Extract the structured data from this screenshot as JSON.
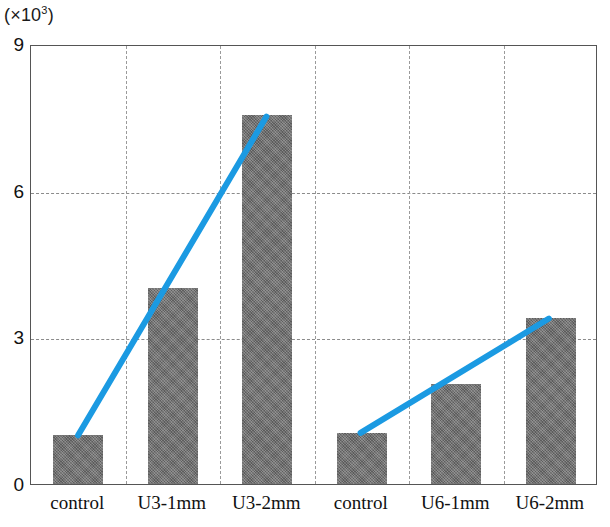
{
  "chart_data": {
    "type": "bar",
    "title": "",
    "subtitle": "",
    "xlabel": "",
    "ylabel": "(×10³)",
    "ylabel_base": "(×10",
    "ylabel_exp": "3",
    "ylabel_close": ")",
    "categories": [
      "control",
      "U3-1mm",
      "U3-2mm",
      "control",
      "U6-1mm",
      "U6-2mm"
    ],
    "values": [
      1.0,
      4.0,
      7.55,
      1.05,
      2.05,
      3.4
    ],
    "series": [
      {
        "name": "bars",
        "type": "bar",
        "values": [
          1.0,
          4.0,
          7.55,
          1.05,
          2.05,
          3.4
        ]
      },
      {
        "name": "U3 trend",
        "type": "line",
        "color": "#1b9ae2",
        "x": [
          "control",
          "U3-2mm"
        ],
        "x_index": [
          0,
          2
        ],
        "values": [
          1.0,
          7.55
        ]
      },
      {
        "name": "U6 trend",
        "type": "line",
        "color": "#1b9ae2",
        "x": [
          "control",
          "U6-2mm"
        ],
        "x_index": [
          3,
          5
        ],
        "values": [
          1.05,
          3.4
        ]
      }
    ],
    "ylim": [
      0,
      9
    ],
    "yticks": [
      0,
      3,
      6,
      9
    ],
    "ytick_labels": [
      "0",
      "3",
      "6",
      "9"
    ],
    "grid": {
      "horizontal": true,
      "vertical": true,
      "horizontal_at": [
        3,
        6
      ],
      "vertical_between_categories": true,
      "style": "dashed",
      "color": "#8f8f8f"
    },
    "legend": {
      "visible": false,
      "position": "none",
      "entries": []
    },
    "annotations": [],
    "colors": {
      "bar_fill": "#6f6f6f",
      "bar_texture": "hatched",
      "trend_line": "#1b9ae2",
      "axis": "#555555",
      "grid": "#8f8f8f",
      "background": "#ffffff",
      "text": "#111111"
    },
    "bar_layout": {
      "bar_width_px": 50,
      "slot_width_px": 94.5,
      "category_count": 6
    }
  }
}
